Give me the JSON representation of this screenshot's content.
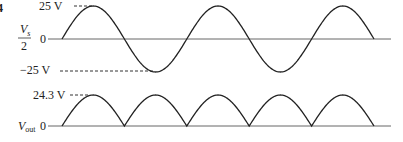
{
  "figure_number_fragment": "4",
  "top_plot": {
    "ylabel_numerator": "V",
    "ylabel_subscript": "s",
    "ylabel_denominator": "2",
    "zero_label": "0",
    "peak_label": "25 V",
    "trough_label": "−25 V",
    "description": "Full sine wave, 2.5 cycles, amplitude 25 V"
  },
  "bottom_plot": {
    "ylabel": "V",
    "ylabel_subscript": "out",
    "zero_label": "0",
    "peak_label": "24.3 V",
    "description": "Full-wave rectified output, 5 half-cycles, peak 24.3 V"
  },
  "chart_data": [
    {
      "type": "line",
      "title": "Vs/2 input waveform",
      "ylabel": "Vs/2",
      "series": [
        {
          "name": "Vs/2",
          "shape": "sine",
          "amplitude": 25,
          "half_cycles": 5
        }
      ],
      "annotations": [
        "25 V",
        "−25 V",
        "0"
      ]
    },
    {
      "type": "line",
      "title": "Vout rectified waveform",
      "ylabel": "Vout",
      "series": [
        {
          "name": "Vout",
          "shape": "full-wave rectified sine",
          "peak": 24.3,
          "half_cycles": 5
        }
      ],
      "annotations": [
        "24.3 V",
        "0"
      ]
    }
  ]
}
